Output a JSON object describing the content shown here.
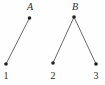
{
  "figure": {
    "title": "",
    "background_color": "#fefefe",
    "width": 105,
    "height": 85
  },
  "style": {
    "edge_color": "#6b6b6b",
    "edge_width": 1,
    "node_color": "#1f1f1f",
    "node_radius": 1.8,
    "label_color": "#2a2a2a",
    "label_font_size": 10
  },
  "graph_data": {
    "type": "node-link-diagram",
    "components": 2,
    "nodes": [
      {
        "id": "A",
        "label": "A",
        "style": "italic",
        "x": 29.5,
        "y": 18,
        "label_x": 30,
        "label_y": 7,
        "role": "parent"
      },
      {
        "id": "B",
        "label": "B",
        "style": "italic",
        "x": 74,
        "y": 17,
        "label_x": 75,
        "label_y": 7,
        "role": "parent"
      },
      {
        "id": "1",
        "label": "1",
        "style": "upright",
        "x": 6,
        "y": 64,
        "label_x": 6,
        "label_y": 76,
        "role": "leaf"
      },
      {
        "id": "2",
        "label": "2",
        "style": "upright",
        "x": 53,
        "y": 63,
        "label_x": 53,
        "label_y": 76,
        "role": "leaf"
      },
      {
        "id": "3",
        "label": "3",
        "style": "upright",
        "x": 96,
        "y": 64,
        "label_x": 96,
        "label_y": 76,
        "role": "leaf"
      }
    ],
    "edges": [
      {
        "from": "A",
        "to": "1",
        "x1": 29.5,
        "y1": 18,
        "x2": 6,
        "y2": 64
      },
      {
        "from": "B",
        "to": "2",
        "x1": 74,
        "y1": 17,
        "x2": 53,
        "y2": 63
      },
      {
        "from": "B",
        "to": "3",
        "x1": 74,
        "y1": 17,
        "x2": 96,
        "y2": 64
      }
    ]
  }
}
